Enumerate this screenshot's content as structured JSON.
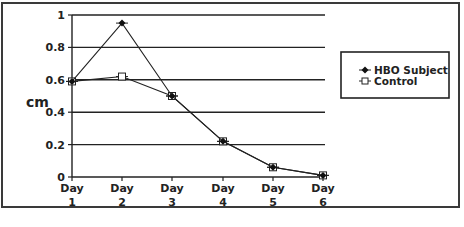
{
  "chart_data": {
    "type": "line",
    "title": "",
    "xlabel": "",
    "ylabel": "cm",
    "categories": [
      "Day 1",
      "Day 2",
      "Day 3",
      "Day 4",
      "Day 5",
      "Day 6"
    ],
    "category_lines": [
      [
        "Day",
        "1"
      ],
      [
        "Day",
        "2"
      ],
      [
        "Day",
        "3"
      ],
      [
        "Day",
        "4"
      ],
      [
        "Day",
        "5"
      ],
      [
        "Day",
        "6"
      ]
    ],
    "series": [
      {
        "name": "HBO Subject",
        "marker": "filled-diamond",
        "values": [
          0.59,
          0.95,
          0.5,
          0.22,
          0.06,
          0.01
        ]
      },
      {
        "name": "Control",
        "marker": "open-square",
        "values": [
          0.59,
          0.62,
          0.5,
          0.22,
          0.06,
          0.01
        ]
      }
    ],
    "ylim": [
      0,
      1
    ],
    "yticks": [
      "0",
      "0.2",
      "0.4",
      "0.6",
      "0.8",
      "1"
    ],
    "grid": true,
    "legend_position": "right"
  },
  "legend": {
    "items": [
      {
        "label": "HBO Subject"
      },
      {
        "label": "Control"
      }
    ]
  },
  "axis": {
    "ylabel": "cm"
  }
}
